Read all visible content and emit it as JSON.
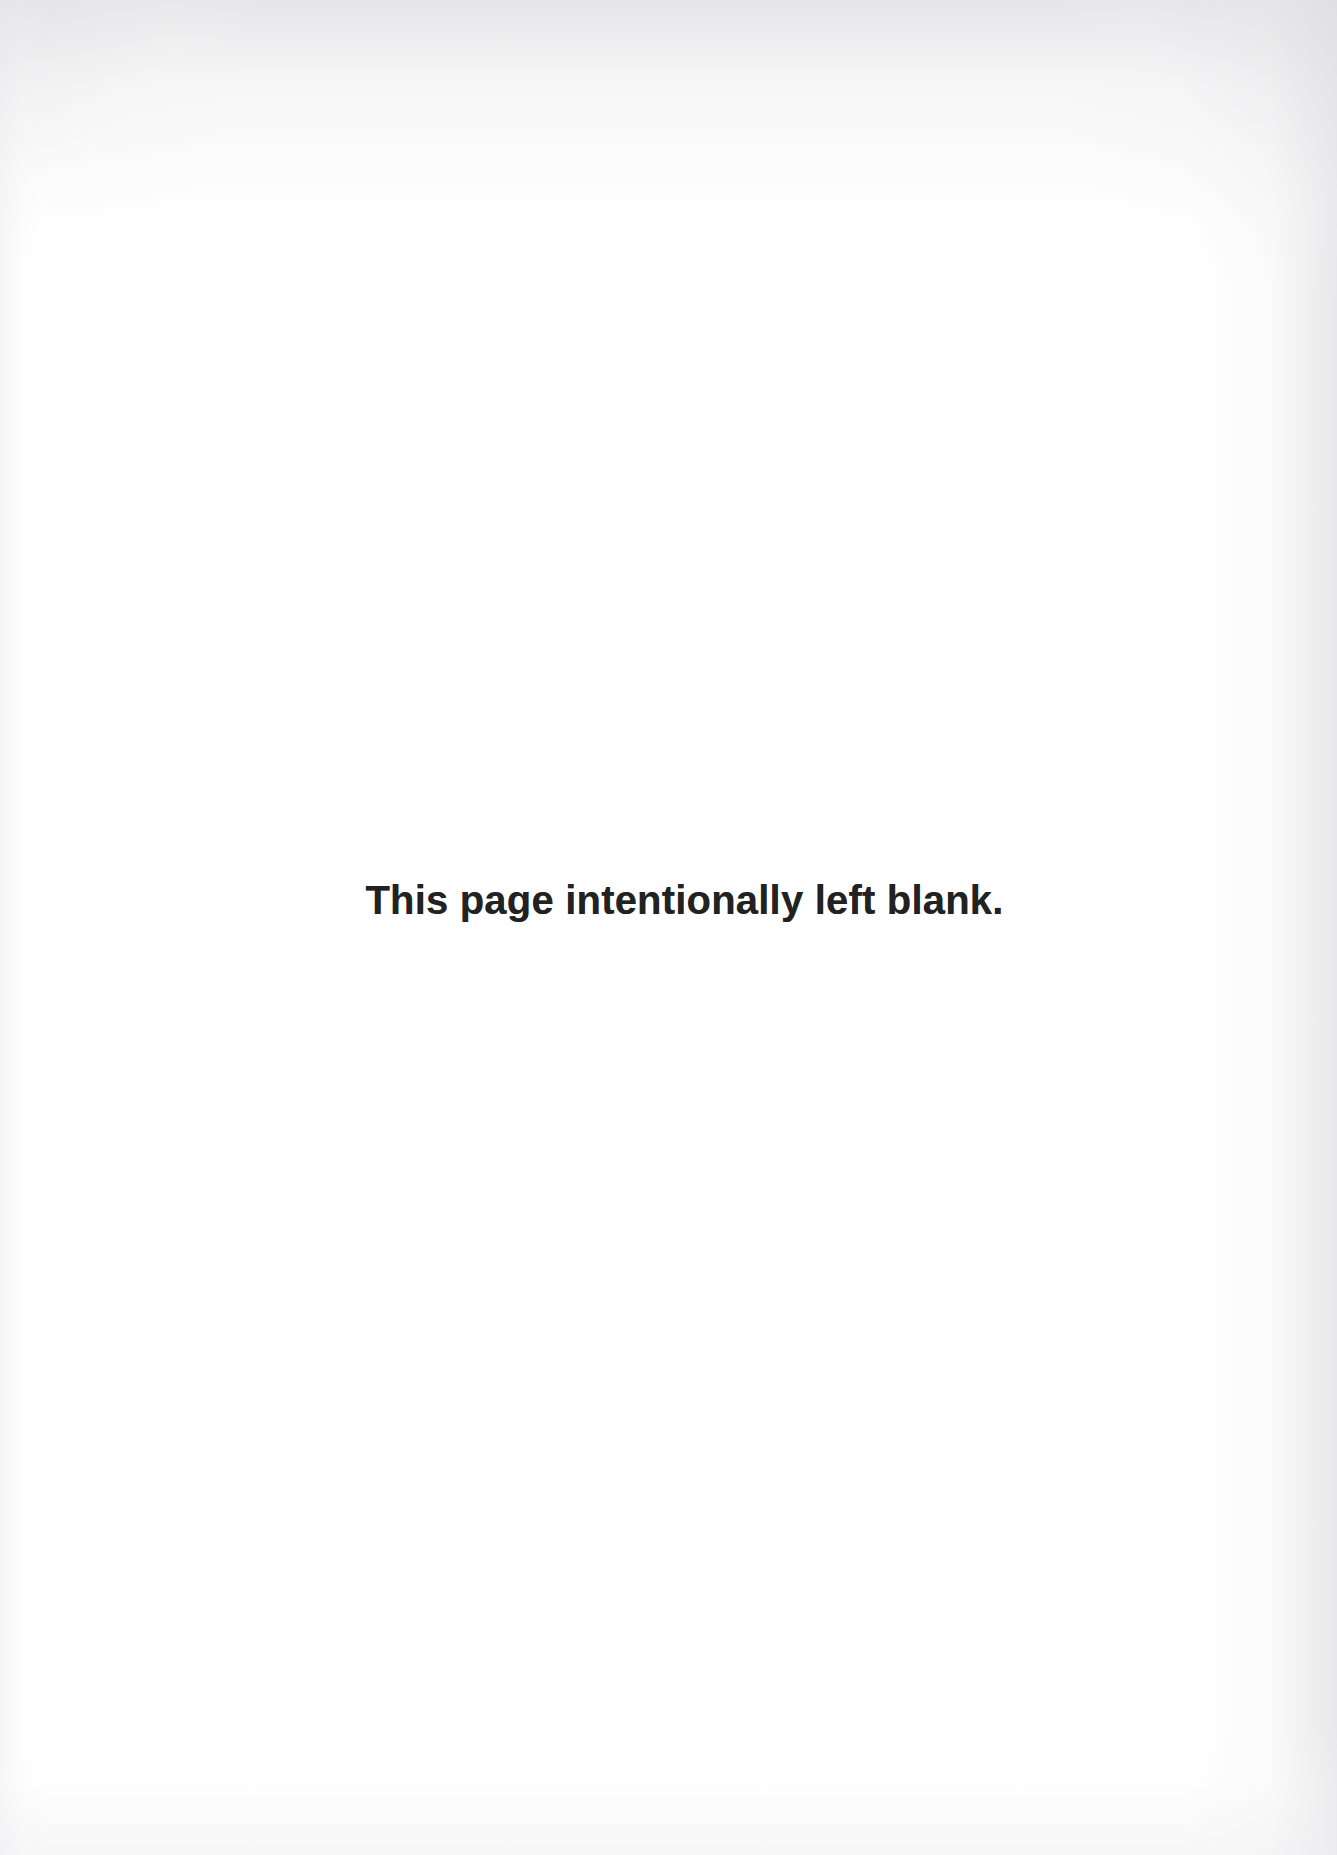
{
  "page": {
    "background_color": "#ffffff",
    "width": 1337,
    "height": 1855,
    "kind": "scanned-book-page"
  },
  "notice": {
    "text": "This page intentionally left blank.",
    "color": "#222222",
    "font_size_px": 40,
    "weight": "bold",
    "align": "center"
  },
  "scan_artifacts": {
    "edge_shadow_color": "#ececec",
    "top_edge": "gray-gradient",
    "right_edge": "gray-gradient",
    "left_edge": "gray-gradient",
    "bottom_edge": "gray-gradient"
  }
}
